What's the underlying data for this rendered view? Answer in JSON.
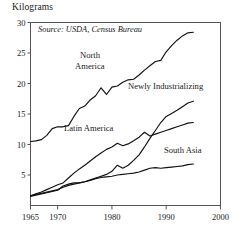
{
  "axis_title": "Kilograms",
  "source_note": "Source: USDA, Census Bureau",
  "annotations": {
    "north_america_line1": "North",
    "north_america_line2": "America",
    "newly_industrializing": "Newly Industrializing",
    "latin_america": "Latin America",
    "south_asia": "South Asia"
  },
  "chart_data": {
    "type": "line",
    "title": "",
    "xlabel": "",
    "ylabel": "Kilograms",
    "xlim": [
      1965,
      2000
    ],
    "ylim": [
      0,
      30
    ],
    "grid": false,
    "legend": "inline-annotations",
    "xticks": [
      1965,
      1970,
      1980,
      1990,
      2000
    ],
    "yticks": [
      5,
      10,
      15,
      20,
      25,
      30
    ],
    "note": "Source: USDA, Census Bureau",
    "series": [
      {
        "name": "North America",
        "x": [
          1965,
          1966,
          1967,
          1968,
          1969,
          1970,
          1971,
          1972,
          1973,
          1974,
          1975,
          1976,
          1977,
          1978,
          1979,
          1980,
          1981,
          1982,
          1983,
          1984,
          1985,
          1986,
          1987,
          1988,
          1989,
          1990,
          1991,
          1992,
          1993,
          1994,
          1995
        ],
        "values": [
          10.5,
          10.6,
          10.8,
          11.5,
          12.6,
          12.9,
          12.9,
          13.1,
          14.6,
          15.9,
          16.3,
          17.3,
          18.0,
          19.3,
          18.2,
          19.4,
          19.6,
          20.2,
          20.6,
          20.7,
          21.4,
          22.2,
          22.9,
          23.6,
          23.8,
          25.2,
          26.2,
          27.1,
          27.8,
          28.3,
          28.4
        ]
      },
      {
        "name": "Newly Industrializing",
        "x": [
          1965,
          1966,
          1967,
          1968,
          1969,
          1970,
          1971,
          1972,
          1973,
          1974,
          1975,
          1976,
          1977,
          1978,
          1979,
          1980,
          1981,
          1982,
          1983,
          1984,
          1985,
          1986,
          1987,
          1988,
          1989,
          1990,
          1991,
          1992,
          1993,
          1994,
          1995
        ],
        "values": [
          1.6,
          1.8,
          2.0,
          2.2,
          2.4,
          2.6,
          3.0,
          3.3,
          3.5,
          3.7,
          3.9,
          4.2,
          4.5,
          4.8,
          5.1,
          5.6,
          6.6,
          6.1,
          6.6,
          7.4,
          8.3,
          9.6,
          11.0,
          12.3,
          13.6,
          14.6,
          15.1,
          15.6,
          16.2,
          16.8,
          17.1
        ]
      },
      {
        "name": "Latin America",
        "x": [
          1965,
          1966,
          1967,
          1968,
          1969,
          1970,
          1971,
          1972,
          1973,
          1974,
          1975,
          1976,
          1977,
          1978,
          1979,
          1980,
          1981,
          1982,
          1983,
          1984,
          1985,
          1986,
          1987,
          1988,
          1989,
          1990,
          1991,
          1992,
          1993,
          1994,
          1995
        ],
        "values": [
          1.6,
          1.9,
          2.2,
          2.6,
          3.0,
          3.4,
          3.7,
          4.5,
          5.3,
          6.0,
          6.6,
          7.3,
          8.0,
          8.6,
          9.2,
          9.6,
          10.2,
          9.8,
          10.1,
          10.6,
          11.2,
          12.0,
          11.4,
          11.7,
          12.0,
          12.3,
          12.6,
          12.9,
          13.2,
          13.5,
          13.6
        ]
      },
      {
        "name": "South Asia",
        "x": [
          1965,
          1966,
          1967,
          1968,
          1969,
          1970,
          1971,
          1972,
          1973,
          1974,
          1975,
          1976,
          1977,
          1978,
          1979,
          1980,
          1981,
          1982,
          1983,
          1984,
          1985,
          1986,
          1987,
          1988,
          1989,
          1990,
          1991,
          1992,
          1993,
          1994,
          1995
        ],
        "values": [
          1.5,
          1.7,
          1.9,
          2.1,
          2.3,
          2.5,
          3.2,
          3.5,
          3.7,
          3.7,
          3.9,
          4.1,
          4.4,
          4.6,
          4.7,
          4.8,
          5.0,
          5.1,
          5.2,
          5.3,
          5.5,
          5.8,
          6.1,
          6.2,
          6.1,
          6.2,
          6.3,
          6.4,
          6.5,
          6.7,
          6.8
        ]
      }
    ]
  }
}
